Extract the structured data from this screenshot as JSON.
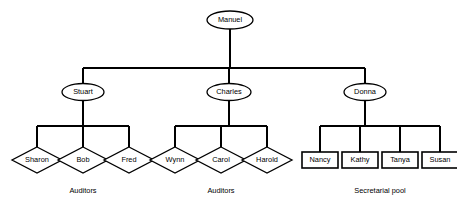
{
  "diagram": {
    "type": "org-chart",
    "background_color": "#ffffff",
    "line_color": "#000000",
    "shape_fill": "#ffffff"
  },
  "nodes": {
    "root": {
      "id": "manuel",
      "label": "Manuel",
      "shape": "ellipse",
      "level": 0,
      "cx": 230,
      "cy": 20,
      "rx": 23,
      "ry": 9
    },
    "managers": [
      {
        "id": "stuart",
        "label": "Stuart",
        "shape": "ellipse",
        "level": 1,
        "cx": 83,
        "cy": 92,
        "rx": 21,
        "ry": 8.5
      },
      {
        "id": "charles",
        "label": "Charles",
        "shape": "ellipse",
        "level": 1,
        "cx": 229,
        "cy": 92,
        "rx": 22,
        "ry": 8.5
      },
      {
        "id": "donna",
        "label": "Donna",
        "shape": "ellipse",
        "level": 1,
        "cx": 365,
        "cy": 92,
        "rx": 21,
        "ry": 8.5
      }
    ],
    "leaves": [
      {
        "id": "sharon",
        "label": "Sharon",
        "shape": "diamond",
        "parent": "stuart",
        "group": "auditors-left",
        "cx": 37,
        "cy": 160,
        "hw": 25,
        "hh": 13
      },
      {
        "id": "bob",
        "label": "Bob",
        "shape": "diamond",
        "parent": "stuart",
        "group": "auditors-left",
        "cx": 83,
        "cy": 160,
        "hw": 25,
        "hh": 13
      },
      {
        "id": "fred",
        "label": "Fred",
        "shape": "diamond",
        "parent": "stuart",
        "group": "auditors-left",
        "cx": 129,
        "cy": 160,
        "hw": 25,
        "hh": 13
      },
      {
        "id": "wynn",
        "label": "Wynn",
        "shape": "diamond",
        "parent": "charles",
        "group": "auditors-middle",
        "cx": 175,
        "cy": 160,
        "hw": 25,
        "hh": 13
      },
      {
        "id": "carol",
        "label": "Carol",
        "shape": "diamond",
        "parent": "charles",
        "group": "auditors-middle",
        "cx": 221,
        "cy": 160,
        "hw": 25,
        "hh": 13
      },
      {
        "id": "harold",
        "label": "Harold",
        "shape": "diamond",
        "parent": "charles",
        "group": "auditors-middle",
        "cx": 267,
        "cy": 160,
        "hw": 25,
        "hh": 13
      },
      {
        "id": "nancy",
        "label": "Nancy",
        "shape": "rect",
        "parent": "donna",
        "group": "secretarial-pool",
        "cx": 320,
        "cy": 160,
        "hw": 18,
        "hh": 8
      },
      {
        "id": "kathy",
        "label": "Kathy",
        "shape": "rect",
        "parent": "donna",
        "group": "secretarial-pool",
        "cx": 360,
        "cy": 160,
        "hw": 18,
        "hh": 8
      },
      {
        "id": "tanya",
        "label": "Tanya",
        "shape": "rect",
        "parent": "donna",
        "group": "secretarial-pool",
        "cx": 400,
        "cy": 160,
        "hw": 18,
        "hh": 8
      },
      {
        "id": "susan",
        "label": "Susan",
        "shape": "rect",
        "parent": "donna",
        "group": "secretarial-pool",
        "cx": 440,
        "cy": 160,
        "hw": 18,
        "hh": 8
      }
    ]
  },
  "group_captions": [
    {
      "id": "auditors-left",
      "label": "Auditors",
      "cx": 83,
      "cy": 191
    },
    {
      "id": "auditors-middle",
      "label": "Auditors",
      "cx": 221,
      "cy": 191
    },
    {
      "id": "secretarial-pool",
      "label": "Secretarial pool",
      "cx": 380,
      "cy": 191
    }
  ],
  "edges": {
    "root_stem": {
      "x": 230,
      "y1": 29,
      "y2": 68
    },
    "root_bus": {
      "y": 68,
      "x1": 83,
      "x2": 365
    },
    "manager_drops": [
      {
        "x": 83,
        "y1": 68,
        "y2": 83.5
      },
      {
        "x": 229,
        "y1": 68,
        "y2": 83.5
      },
      {
        "x": 365,
        "y1": 68,
        "y2": 83.5
      }
    ],
    "subtrees": [
      {
        "parent": "stuart",
        "stem": {
          "x": 83,
          "y1": 100.5,
          "y2": 126
        },
        "bus": {
          "y": 126,
          "x1": 37,
          "x2": 129
        },
        "drops": [
          {
            "x": 37,
            "y1": 126,
            "y2": 147
          },
          {
            "x": 83,
            "y1": 126,
            "y2": 147
          },
          {
            "x": 129,
            "y1": 126,
            "y2": 147
          }
        ]
      },
      {
        "parent": "charles",
        "stem": {
          "x": 229,
          "y1": 100.5,
          "y2": 126
        },
        "bus": {
          "y": 126,
          "x1": 175,
          "x2": 267
        },
        "drops": [
          {
            "x": 175,
            "y1": 126,
            "y2": 147
          },
          {
            "x": 221,
            "y1": 126,
            "y2": 147
          },
          {
            "x": 267,
            "y1": 126,
            "y2": 147
          }
        ]
      },
      {
        "parent": "donna",
        "stem": {
          "x": 365,
          "y1": 100.5,
          "y2": 126
        },
        "bus": {
          "y": 126,
          "x1": 320,
          "x2": 440
        },
        "drops": [
          {
            "x": 320,
            "y1": 126,
            "y2": 152
          },
          {
            "x": 360,
            "y1": 126,
            "y2": 152
          },
          {
            "x": 400,
            "y1": 126,
            "y2": 152
          },
          {
            "x": 440,
            "y1": 126,
            "y2": 152
          }
        ]
      }
    ]
  }
}
